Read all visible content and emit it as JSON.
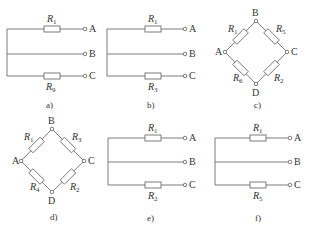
{
  "panels": [
    {
      "id": "a",
      "caption": "a)",
      "type": "parallel",
      "top_resistor": {
        "name": "R",
        "sub": "1"
      },
      "bottom_resistor": {
        "name": "R",
        "sub": "9"
      },
      "terminals": [
        "A",
        "B",
        "C"
      ]
    },
    {
      "id": "b",
      "caption": "b)",
      "type": "parallel",
      "top_resistor": {
        "name": "R",
        "sub": "1"
      },
      "bottom_resistor": {
        "name": "R",
        "sub": "3"
      },
      "terminals": [
        "A",
        "B",
        "C"
      ]
    },
    {
      "id": "c",
      "caption": "c)",
      "type": "bridge",
      "nodes": [
        "A",
        "B",
        "C",
        "D"
      ],
      "resistors": {
        "AB": {
          "name": "R",
          "sub": "1"
        },
        "BC": {
          "name": "R",
          "sub": "5"
        },
        "CD": {
          "name": "R",
          "sub": "2"
        },
        "DA": {
          "name": "R",
          "sub": "6"
        }
      }
    },
    {
      "id": "d",
      "caption": "d)",
      "type": "bridge",
      "nodes": [
        "A",
        "B",
        "C",
        "D"
      ],
      "resistors": {
        "AB": {
          "name": "R",
          "sub": "1"
        },
        "BC": {
          "name": "R",
          "sub": "3"
        },
        "CD": {
          "name": "R",
          "sub": "2"
        },
        "DA": {
          "name": "R",
          "sub": "4"
        }
      }
    },
    {
      "id": "e",
      "caption": "e)",
      "type": "parallel",
      "top_resistor": {
        "name": "R",
        "sub": "1"
      },
      "bottom_resistor": {
        "name": "R",
        "sub": "2"
      },
      "terminals": [
        "A",
        "B",
        "C"
      ]
    },
    {
      "id": "f",
      "caption": "f)",
      "type": "parallel",
      "top_resistor": {
        "name": "R",
        "sub": "1"
      },
      "bottom_resistor": {
        "name": "R",
        "sub": "5"
      },
      "terminals": [
        "A",
        "B",
        "C"
      ]
    }
  ]
}
